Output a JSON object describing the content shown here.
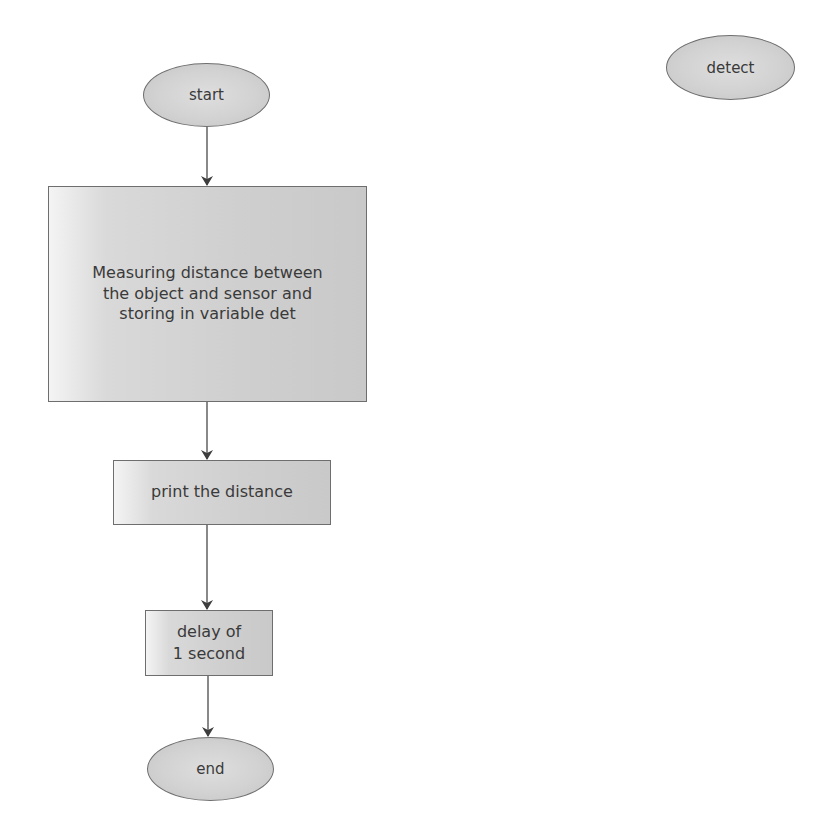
{
  "diagram": {
    "type": "flowchart",
    "nodes": [
      {
        "id": "start",
        "shape": "ellipse",
        "label": "start"
      },
      {
        "id": "measure",
        "shape": "rectangle",
        "label": "Measuring distance between\nthe object and sensor and\nstoring in variable det"
      },
      {
        "id": "print",
        "shape": "rectangle",
        "label": "print the distance"
      },
      {
        "id": "delay",
        "shape": "rectangle",
        "label": "delay of\n1 second"
      },
      {
        "id": "end",
        "shape": "ellipse",
        "label": "end"
      },
      {
        "id": "detect",
        "shape": "ellipse",
        "label": "detect"
      }
    ],
    "edges": [
      {
        "from": "start",
        "to": "measure"
      },
      {
        "from": "measure",
        "to": "print"
      },
      {
        "from": "print",
        "to": "delay"
      },
      {
        "from": "delay",
        "to": "end"
      }
    ],
    "colors": {
      "node_fill": "#d0d0d0",
      "node_border": "#6e6e6e",
      "text": "#3a3a3a",
      "edge": "#4a4a4a",
      "background": "#ffffff"
    }
  }
}
